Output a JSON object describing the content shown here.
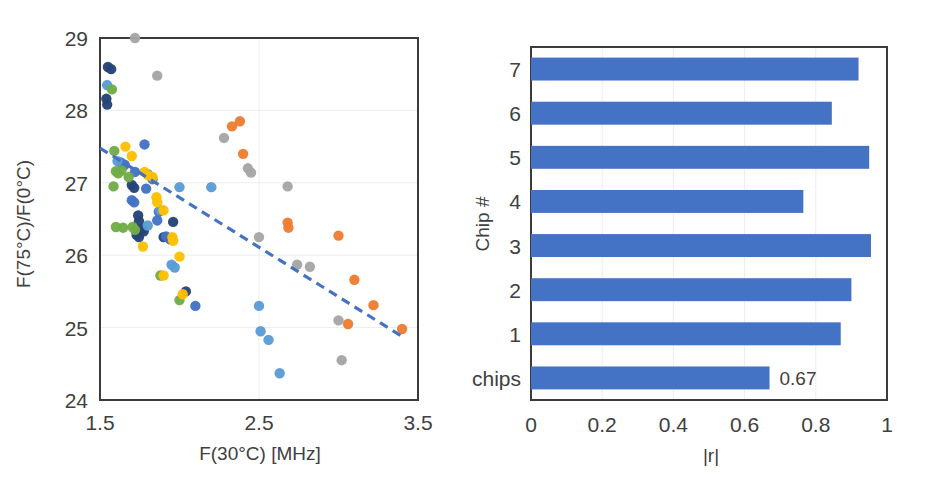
{
  "figure": {
    "title": "",
    "panels": [
      "scatter-panel",
      "bar-panel"
    ]
  },
  "colors": {
    "series_blue_medium": "#4472C4",
    "series_orange": "#ED7D31",
    "series_gray": "#A5A5A5",
    "series_gold": "#FFC000",
    "series_blue_light": "#5B9BD5",
    "series_green": "#70AD47",
    "series_navy": "#264478",
    "bar_fill": "#4472C4",
    "trendline": "#4472C4",
    "axis_line": "#3B3B3B",
    "gridline": "#EDEDED",
    "text": "#404040"
  },
  "chart_data": [
    {
      "id": "scatter-panel",
      "type": "scatter",
      "title": "",
      "xlabel": "F(30°C) [MHz]",
      "ylabel": "F(75°C)/F(0°C)",
      "xlim": [
        1.5,
        3.5
      ],
      "ylim": [
        24,
        29
      ],
      "xticks": [
        1.5,
        2.5,
        3.5
      ],
      "xticklabels": [
        "1.5",
        "2.5",
        "3.5"
      ],
      "yticks": [
        24,
        25,
        26,
        27,
        28,
        29
      ],
      "yticklabels": [
        "24",
        "25",
        "26",
        "27",
        "28",
        "29"
      ],
      "grid": "horizontal-and-vertical-light",
      "legend": "none",
      "trendline": {
        "style": "dashed",
        "color": "#4472C4",
        "x": [
          1.5,
          3.42
        ],
        "y": [
          27.48,
          24.85
        ]
      },
      "series": [
        {
          "name": "navy",
          "color": "#264478",
          "points": [
            [
              1.55,
              28.6
            ],
            [
              1.57,
              28.57
            ],
            [
              1.54,
              28.16
            ],
            [
              1.545,
              28.08
            ],
            [
              1.7,
              26.97
            ],
            [
              1.715,
              26.93
            ],
            [
              1.74,
              26.55
            ],
            [
              1.745,
              26.47
            ],
            [
              1.73,
              26.28
            ],
            [
              1.745,
              26.25
            ],
            [
              1.76,
              26.36
            ],
            [
              1.775,
              26.33
            ],
            [
              1.96,
              26.46
            ],
            [
              2.04,
              25.5
            ],
            [
              1.9,
              26.25
            ]
          ]
        },
        {
          "name": "blue-medium",
          "color": "#4472C4",
          "points": [
            [
              1.63,
              27.28
            ],
            [
              1.655,
              27.25
            ],
            [
              1.78,
              27.53
            ],
            [
              1.7,
              26.76
            ],
            [
              1.715,
              26.73
            ],
            [
              1.83,
              27.05
            ],
            [
              1.8,
              27.12
            ],
            [
              1.87,
              26.6
            ],
            [
              1.915,
              26.26
            ],
            [
              1.94,
              26.22
            ],
            [
              2.1,
              25.3
            ],
            [
              1.72,
              27.15
            ],
            [
              1.79,
              26.92
            ],
            [
              1.86,
              26.48
            ]
          ]
        },
        {
          "name": "blue-light",
          "color": "#5B9BD5",
          "points": [
            [
              1.545,
              28.35
            ],
            [
              1.61,
              27.3
            ],
            [
              1.88,
              26.62
            ],
            [
              2.0,
              26.94
            ],
            [
              1.95,
              25.87
            ],
            [
              1.97,
              25.83
            ],
            [
              2.5,
              25.3
            ],
            [
              2.51,
              24.95
            ],
            [
              2.56,
              24.83
            ],
            [
              2.63,
              24.37
            ],
            [
              1.8,
              26.41
            ],
            [
              2.2,
              26.94
            ]
          ]
        },
        {
          "name": "green",
          "color": "#70AD47",
          "points": [
            [
              1.575,
              28.29
            ],
            [
              1.59,
              27.44
            ],
            [
              1.6,
              27.16
            ],
            [
              1.615,
              27.13
            ],
            [
              1.585,
              26.95
            ],
            [
              1.635,
              27.17
            ],
            [
              1.68,
              27.08
            ],
            [
              1.645,
              26.38
            ],
            [
              1.705,
              26.39
            ],
            [
              1.72,
              26.35
            ],
            [
              1.6,
              26.39
            ],
            [
              1.88,
              25.72
            ],
            [
              2.0,
              25.38
            ]
          ]
        },
        {
          "name": "gold",
          "color": "#FFC000",
          "points": [
            [
              1.66,
              27.5
            ],
            [
              1.7,
              27.37
            ],
            [
              1.78,
              27.15
            ],
            [
              1.8,
              27.11
            ],
            [
              1.83,
              27.08
            ],
            [
              1.855,
              26.8
            ],
            [
              1.86,
              26.73
            ],
            [
              1.9,
              26.62
            ],
            [
              1.77,
              26.12
            ],
            [
              1.955,
              26.25
            ],
            [
              1.96,
              26.2
            ],
            [
              2.0,
              25.98
            ],
            [
              1.9,
              25.72
            ],
            [
              2.02,
              25.46
            ]
          ]
        },
        {
          "name": "orange",
          "color": "#ED7D31",
          "points": [
            [
              2.38,
              27.85
            ],
            [
              2.33,
              27.78
            ],
            [
              2.4,
              27.4
            ],
            [
              2.68,
              26.45
            ],
            [
              2.685,
              26.38
            ],
            [
              3.0,
              26.27
            ],
            [
              3.1,
              25.66
            ],
            [
              3.22,
              25.31
            ],
            [
              3.06,
              25.05
            ],
            [
              3.4,
              24.98
            ]
          ]
        },
        {
          "name": "gray",
          "color": "#A5A5A5",
          "points": [
            [
              1.72,
              29.0
            ],
            [
              1.86,
              28.48
            ],
            [
              2.28,
              27.62
            ],
            [
              2.43,
              27.2
            ],
            [
              2.45,
              27.14
            ],
            [
              2.68,
              26.95
            ],
            [
              2.5,
              26.25
            ],
            [
              2.74,
              25.87
            ],
            [
              2.82,
              25.84
            ],
            [
              3.0,
              25.1
            ],
            [
              3.02,
              24.55
            ]
          ]
        }
      ]
    },
    {
      "id": "bar-panel",
      "type": "bar",
      "orientation": "horizontal",
      "title": "",
      "xlabel": "|r|",
      "ylabel": "Chip #",
      "categories": [
        "All chips",
        "1",
        "2",
        "3",
        "4",
        "5",
        "6",
        "7"
      ],
      "values": [
        0.67,
        0.87,
        0.9,
        0.955,
        0.765,
        0.95,
        0.845,
        0.92
      ],
      "data_labels": [
        {
          "category": "All chips",
          "text": "0.67"
        }
      ],
      "xlim": [
        0,
        1
      ],
      "xticks": [
        0,
        0.2,
        0.4,
        0.6,
        0.8,
        1
      ],
      "xticklabels": [
        "0",
        "0.2",
        "0.4",
        "0.6",
        "0.8",
        "1"
      ],
      "grid": "vertical",
      "legend": "none",
      "bar_color": "#4472C4"
    }
  ]
}
